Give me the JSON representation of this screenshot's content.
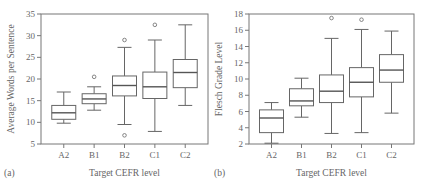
{
  "chart_data": [
    {
      "type": "box",
      "panel_label": "(a)",
      "title": "",
      "xlabel": "Target CEFR level",
      "ylabel": "Average Words per Sentence",
      "ylim": [
        5,
        35
      ],
      "yticks": [
        5,
        10,
        15,
        20,
        25,
        30,
        35
      ],
      "grid": false,
      "categories": [
        "A2",
        "B1",
        "B2",
        "C1",
        "C2"
      ],
      "boxes": [
        {
          "category": "A2",
          "whisker_low": 9.8,
          "q1": 10.7,
          "median": 12.2,
          "q3": 13.9,
          "whisker_high": 17.0,
          "outliers": []
        },
        {
          "category": "B1",
          "whisker_low": 12.8,
          "q1": 14.3,
          "median": 15.4,
          "q3": 16.6,
          "whisker_high": 18.2,
          "outliers": [
            20.5
          ]
        },
        {
          "category": "B2",
          "whisker_low": 9.5,
          "q1": 16.1,
          "median": 18.5,
          "q3": 20.7,
          "whisker_high": 27.3,
          "outliers": [
            29.0,
            7.0
          ]
        },
        {
          "category": "C1",
          "whisker_low": 7.9,
          "q1": 15.5,
          "median": 18.2,
          "q3": 21.6,
          "whisker_high": 29.0,
          "outliers": [
            32.5
          ]
        },
        {
          "category": "C2",
          "whisker_low": 13.9,
          "q1": 18.0,
          "median": 21.5,
          "q3": 24.5,
          "whisker_high": 32.5,
          "outliers": []
        }
      ]
    },
    {
      "type": "box",
      "panel_label": "(b)",
      "title": "",
      "xlabel": "Target CEFR level",
      "ylabel": "Flesch Grade Level",
      "ylim": [
        2,
        18
      ],
      "yticks": [
        2,
        4,
        6,
        8,
        10,
        12,
        14,
        16,
        18
      ],
      "grid": false,
      "categories": [
        "A2",
        "B1",
        "B2",
        "C1",
        "C2"
      ],
      "boxes": [
        {
          "category": "A2",
          "whisker_low": 2.1,
          "q1": 3.4,
          "median": 5.2,
          "q3": 6.2,
          "whisker_high": 7.1,
          "outliers": []
        },
        {
          "category": "B1",
          "whisker_low": 5.3,
          "q1": 6.7,
          "median": 7.3,
          "q3": 8.8,
          "whisker_high": 10.1,
          "outliers": []
        },
        {
          "category": "B2",
          "whisker_low": 3.3,
          "q1": 7.1,
          "median": 8.5,
          "q3": 10.5,
          "whisker_high": 15.0,
          "outliers": [
            17.5
          ]
        },
        {
          "category": "C1",
          "whisker_low": 3.4,
          "q1": 7.8,
          "median": 9.6,
          "q3": 11.4,
          "whisker_high": 16.1,
          "outliers": [
            17.3
          ]
        },
        {
          "category": "C2",
          "whisker_low": 5.8,
          "q1": 9.6,
          "median": 11.1,
          "q3": 13.0,
          "whisker_high": 15.9,
          "outliers": []
        }
      ]
    }
  ]
}
